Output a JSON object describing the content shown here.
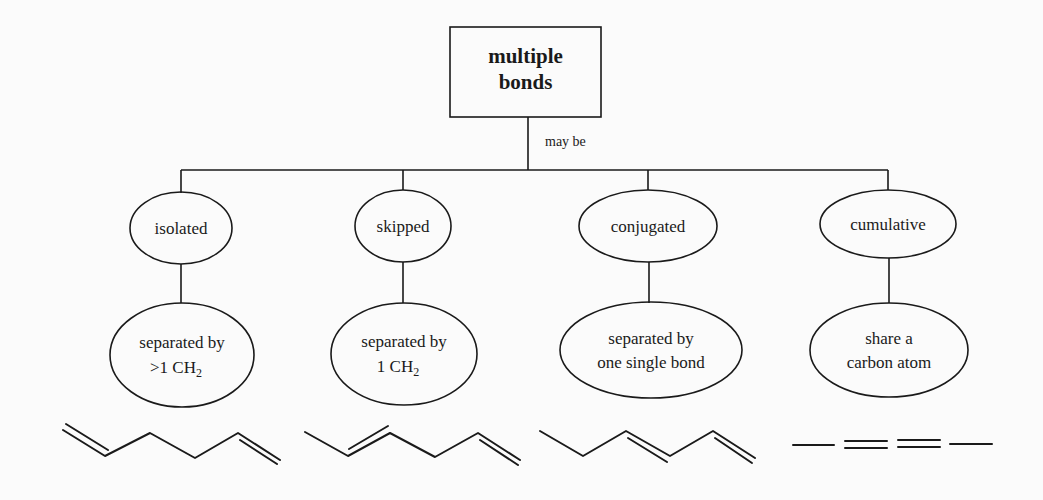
{
  "diagram": {
    "root": {
      "line1": "multiple",
      "line2": "bonds"
    },
    "edge_label": "may be",
    "categories": [
      {
        "name": "isolated",
        "desc_line1": "separated by",
        "desc_line2_prefix": ">1  CH",
        "desc_line2_sub": "2",
        "molecule": "1,5-hexadiene (skeletal)"
      },
      {
        "name": "skipped",
        "desc_line1": "separated by",
        "desc_line2_prefix": "1  CH",
        "desc_line2_sub": "2",
        "molecule": "1,4-hexadiene (skeletal)"
      },
      {
        "name": "conjugated",
        "desc_line1": "separated by",
        "desc_line2": "one single bond",
        "molecule": "1,3-hexadiene (skeletal)"
      },
      {
        "name": "cumulative",
        "desc_line1": "share a",
        "desc_line2": "carbon atom",
        "molecule": "—==—"
      }
    ]
  }
}
